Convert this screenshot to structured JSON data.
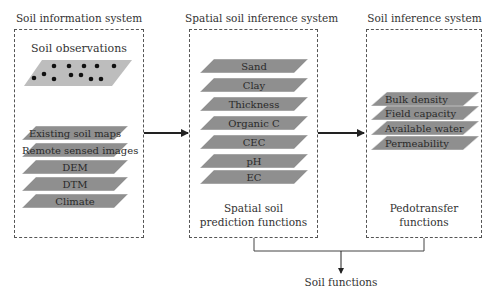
{
  "panels": {
    "left": {
      "title": "Soil information system",
      "subtitle": "Soil observations",
      "layers": [
        "Existing soil maps",
        "Remote sensed images",
        "DEM",
        "DTM",
        "Climate"
      ]
    },
    "middle": {
      "title": "Spatial soil inference system",
      "layers": [
        "Sand",
        "Clay",
        "Thickness",
        "Organic C",
        "CEC",
        "pH",
        "EC"
      ],
      "caption_line1": "Spatial soil",
      "caption_line2": "prediction functions"
    },
    "right": {
      "title": "Soil inference system",
      "layers": [
        "Bulk density",
        "Field capacity",
        "Available water",
        "Permeability"
      ],
      "caption_line1": "Pedotransfer",
      "caption_line2": "functions"
    }
  },
  "output_label": "Soil functions",
  "colors": {
    "layer_fill": "#8f8f8f",
    "observation_fill": "#bdbdbd",
    "dot": "#111111",
    "border": "#555555"
  }
}
